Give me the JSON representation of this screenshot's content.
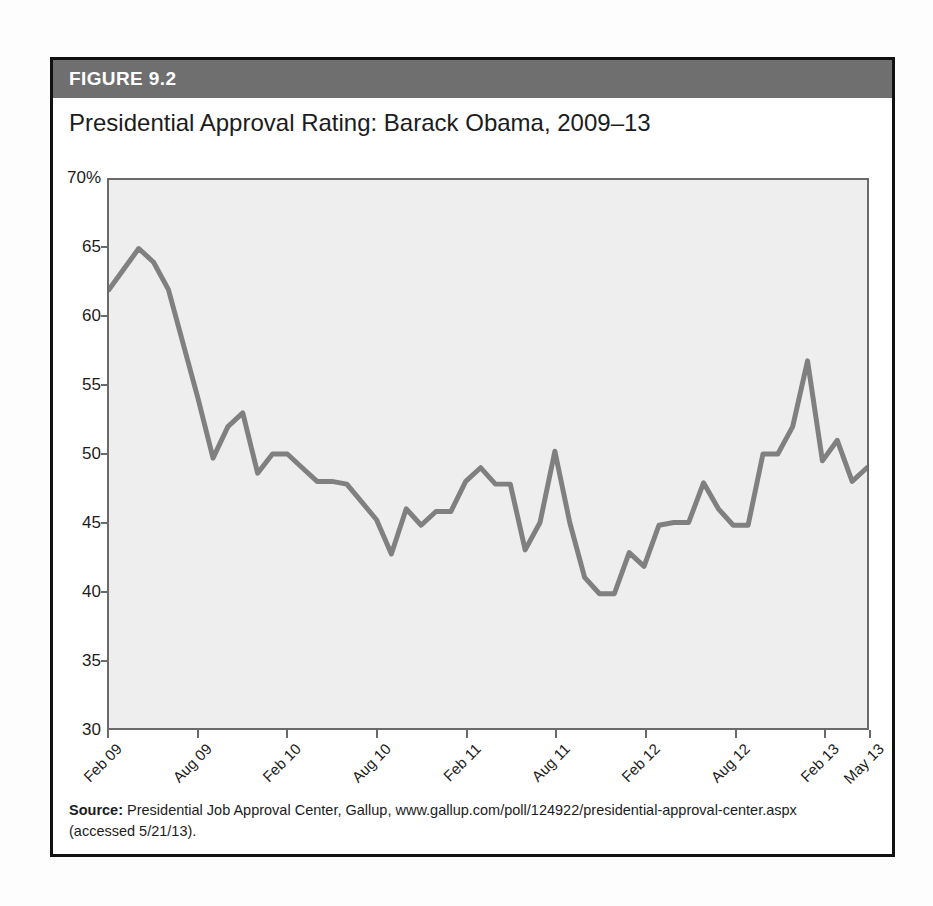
{
  "figure": {
    "header_label": "FIGURE 9.2",
    "header_color": "#6f6f6f",
    "border_color": "#111111"
  },
  "source": {
    "label": "Source:",
    "line1": " Presidential Job Approval Center, Gallup, www.gallup.com/poll/124922/presidential-approval-center.aspx",
    "line2": "(accessed 5/21/13)."
  },
  "chart_data": {
    "type": "line",
    "title": "Presidential Approval Rating: Barack Obama, 2009–13",
    "xlabel": "",
    "ylabel": "",
    "ylim": [
      30,
      70
    ],
    "yticks": [
      30,
      35,
      40,
      45,
      50,
      55,
      60,
      65,
      70
    ],
    "ytick_labels": [
      "30",
      "35",
      "40",
      "45",
      "50",
      "55",
      "60",
      "65",
      "70%"
    ],
    "grid": false,
    "legend": "none",
    "line_color": "#808080",
    "plot_background": "#eeeeee",
    "xtick_labels": [
      "Feb 09",
      "Aug 09",
      "Feb 10",
      "Aug 10",
      "Feb 11",
      "Aug 11",
      "Feb 12",
      "Aug 12",
      "Feb 13",
      "May 13"
    ],
    "xtick_positions": [
      0,
      6,
      12,
      18,
      24,
      30,
      36,
      42,
      48,
      51
    ],
    "x": [
      0,
      1,
      2,
      3,
      4,
      5,
      6,
      7,
      8,
      9,
      10,
      11,
      12,
      13,
      14,
      15,
      16,
      17,
      18,
      19,
      20,
      21,
      22,
      23,
      24,
      25,
      26,
      27,
      28,
      29,
      30,
      31,
      32,
      33,
      34,
      35,
      36,
      37,
      38,
      39,
      40,
      41,
      42,
      43,
      44,
      45,
      46,
      47,
      48,
      49,
      50,
      51
    ],
    "values": [
      62.0,
      63.5,
      65.0,
      64.0,
      62.0,
      58.0,
      54.0,
      49.7,
      52.0,
      53.0,
      48.6,
      50.0,
      50.0,
      49.0,
      48.0,
      48.0,
      47.8,
      46.5,
      45.2,
      42.7,
      46.0,
      44.8,
      45.8,
      45.8,
      48.0,
      49.0,
      47.8,
      47.8,
      43.0,
      45.0,
      50.2,
      45.0,
      41.0,
      39.8,
      39.8,
      42.8,
      41.8,
      44.8,
      45.0,
      45.0,
      47.9,
      46.0,
      44.8,
      44.8,
      50.0,
      50.0,
      52.0,
      56.8,
      49.5,
      51.0,
      48.0,
      49.0
    ],
    "series_name": "Approval %"
  }
}
